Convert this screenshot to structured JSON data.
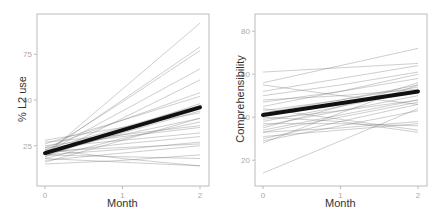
{
  "chart_data": [
    {
      "type": "line",
      "title": "",
      "xlabel": "Month",
      "ylabel": "% L2 use",
      "x_ticks": [
        0,
        1,
        2
      ],
      "y_ticks": [
        25,
        50,
        75
      ],
      "xlim": [
        -0.05,
        2.05
      ],
      "ylim": [
        3,
        97
      ],
      "grid": false,
      "legend": "none",
      "mean_series": {
        "name": "mean",
        "x": [
          0,
          1,
          2
        ],
        "values": [
          21,
          33.5,
          46
        ]
      },
      "individual_series": [
        [
          20,
          56,
          92
        ],
        [
          21,
          50,
          79
        ],
        [
          22,
          49,
          77
        ],
        [
          19,
          40,
          61
        ],
        [
          24,
          39,
          54
        ],
        [
          23,
          35,
          47
        ],
        [
          20,
          32,
          44
        ],
        [
          22,
          31,
          40
        ],
        [
          18,
          29,
          38
        ],
        [
          25,
          30,
          35
        ],
        [
          21,
          26,
          30
        ],
        [
          17,
          21,
          25
        ],
        [
          20,
          19,
          18
        ],
        [
          23,
          18,
          14
        ],
        [
          15,
          17,
          20
        ],
        [
          28,
          35,
          43
        ],
        [
          26,
          39,
          52
        ],
        [
          19,
          34,
          48
        ],
        [
          16,
          28,
          40
        ],
        [
          22,
          24,
          26
        ],
        [
          24,
          28,
          32
        ],
        [
          20,
          23,
          27
        ],
        [
          18,
          16,
          14
        ],
        [
          27,
          31,
          36
        ],
        [
          21,
          44,
          67
        ]
      ]
    },
    {
      "type": "line",
      "title": "",
      "xlabel": "Month",
      "ylabel": "Comprehensibility",
      "x_ticks": [
        0,
        1,
        2
      ],
      "y_ticks": [
        20,
        40,
        60,
        80
      ],
      "xlim": [
        -0.05,
        2.05
      ],
      "ylim": [
        8,
        88
      ],
      "grid": false,
      "legend": "none",
      "mean_series": {
        "name": "mean",
        "x": [
          0,
          1,
          2
        ],
        "values": [
          41,
          46.5,
          52
        ]
      },
      "individual_series": [
        [
          56,
          64,
          72
        ],
        [
          61,
          63,
          65
        ],
        [
          52,
          58,
          64
        ],
        [
          50,
          55,
          61
        ],
        [
          45,
          52,
          60
        ],
        [
          42,
          48,
          54
        ],
        [
          38,
          45,
          52
        ],
        [
          36,
          43,
          50
        ],
        [
          34,
          41,
          48
        ],
        [
          33,
          40,
          47
        ],
        [
          30,
          38,
          46
        ],
        [
          29,
          36,
          43
        ],
        [
          37,
          37,
          36
        ],
        [
          31,
          34,
          37
        ],
        [
          44,
          39,
          34
        ],
        [
          14,
          29,
          44
        ],
        [
          48,
          50,
          53
        ],
        [
          39,
          43,
          48
        ],
        [
          35,
          45,
          56
        ],
        [
          40,
          38,
          33
        ],
        [
          47,
          52,
          58
        ],
        [
          55,
          50,
          46
        ],
        [
          28,
          42,
          55
        ],
        [
          33,
          35,
          38
        ],
        [
          43,
          48,
          55
        ]
      ]
    }
  ],
  "panels": [
    {
      "ylabel": "% L2 use",
      "xlabel": "Month",
      "xticks": [
        "0",
        "1",
        "2"
      ],
      "yticks": [
        "25",
        "50",
        "75"
      ]
    },
    {
      "ylabel": "Comprehensibility",
      "xlabel": "Month",
      "xticks": [
        "0",
        "1",
        "2"
      ],
      "yticks": [
        "20",
        "40",
        "60",
        "80"
      ]
    }
  ],
  "colors": {
    "mean_line": "#111111",
    "individual_line": "#777777",
    "axis": "#bbbbbb",
    "tick_text": "#aaaaaa",
    "label_text": "#333333"
  }
}
